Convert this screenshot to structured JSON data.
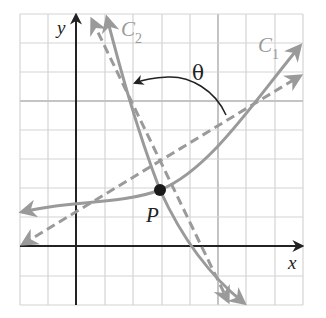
{
  "figure": {
    "labels": {
      "y_axis": "y",
      "x_axis": "x",
      "curve1": "C",
      "curve1_sub": "1",
      "curve2": "C",
      "curve2_sub": "2",
      "point": "P",
      "angle": "θ"
    },
    "colors": {
      "axis": "#222222",
      "curve": "#9a9a9a",
      "tangent_dashed": "#9a9a9a",
      "grid": "#d4d4d4",
      "grid_major": "#c4c4c4",
      "point": "#1a1a1a",
      "label_curve": "#9a9a9a",
      "angle_arc": "#222222"
    }
  }
}
